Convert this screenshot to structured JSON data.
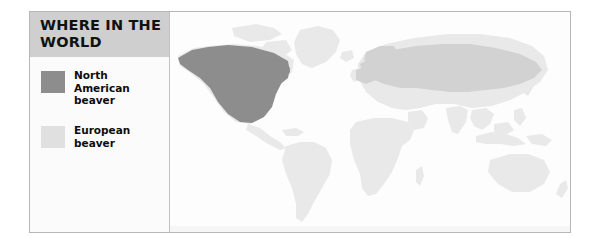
{
  "figure": {
    "kind": "range-distribution-map",
    "title": "WHERE IN THE WORLD"
  },
  "legend": {
    "heading": "WHERE IN THE WORLD",
    "entries": [
      {
        "label": "North American beaver",
        "label_lines": [
          "North",
          "American",
          "beaver"
        ],
        "swatch_color": "#8d8d8d",
        "swatch_tone": "dark-gray"
      },
      {
        "label": "European beaver",
        "label_lines": [
          "European",
          "beaver"
        ],
        "swatch_color": "#e0e0e0",
        "swatch_tone": "light-gray"
      }
    ]
  },
  "map": {
    "projection": "world-equirectangular",
    "background_color": "#fdfdfd",
    "land_color": "#e9e9e9",
    "border_color": "#b6b6b6",
    "regions": [
      {
        "name": "North American beaver range",
        "color": "#8d8d8d",
        "covers": [
          "Alaska",
          "Canada",
          "Contiguous United States"
        ]
      },
      {
        "name": "European beaver range",
        "color": "#d2d2d2",
        "covers": [
          "Northern Europe",
          "Eastern Europe",
          "Russia",
          "Siberia",
          "Central Asia"
        ]
      }
    ],
    "unshaded_landmasses": [
      "South America",
      "Africa",
      "Australia",
      "Greenland",
      "Southeast Asia",
      "India",
      "New Zealand"
    ]
  }
}
